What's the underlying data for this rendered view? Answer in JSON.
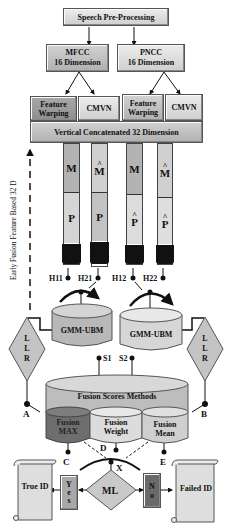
{
  "title": "Speech Pre-Processing",
  "features": {
    "mfcc": {
      "name": "MFCC",
      "dim": "16 Dimension"
    },
    "pncc": {
      "name": "PNCC",
      "dim": "16 Dimension"
    }
  },
  "normalization": {
    "left": {
      "fw": "Feature Warping",
      "cmvn": "CMVN"
    },
    "right": {
      "fw": "Feature Warping",
      "cmvn": "CMVN"
    }
  },
  "concat": "Vertical Concatenated 32 Dimension",
  "side_label": "Early Fusion Feature Based 32 D",
  "tubes": [
    {
      "top": "M",
      "top_hat": "",
      "bottom": "P",
      "bottom_hat": "",
      "h": "H11"
    },
    {
      "top": "M",
      "top_hat": "^",
      "bottom": "P",
      "bottom_hat": "",
      "h": "H21"
    },
    {
      "top": "M",
      "top_hat": "",
      "bottom": "P",
      "bottom_hat": "^",
      "h": "H12"
    },
    {
      "top": "M",
      "top_hat": "^",
      "bottom": "P",
      "bottom_hat": "^",
      "h": "H22"
    }
  ],
  "models": {
    "left": "GMM-UBM",
    "right": "GMM-UBM"
  },
  "llr": {
    "left": [
      "L",
      "L",
      "R"
    ],
    "right": [
      "L",
      "L",
      "R"
    ]
  },
  "scores": {
    "s1": "S1",
    "s2": "S2"
  },
  "fusion": {
    "title": "Fusion Scores Methods",
    "max": "Fusion MAX",
    "weight": "Fusion Weight",
    "mean": "Fusion Mean"
  },
  "points": {
    "a": "A",
    "b": "B",
    "c": "C",
    "d": "D",
    "e": "E",
    "x": "X"
  },
  "decision": {
    "ml": "ML",
    "yes": [
      "Y",
      "e",
      "s"
    ],
    "no": [
      "N",
      "o"
    ]
  },
  "outcomes": {
    "true_id": "True ID",
    "failed_id": "Failed ID"
  },
  "colors": {
    "light": "#d9d9d9",
    "mid": "#b5b5b5",
    "dark": "#6e6e6e",
    "cap": "#111111"
  }
}
